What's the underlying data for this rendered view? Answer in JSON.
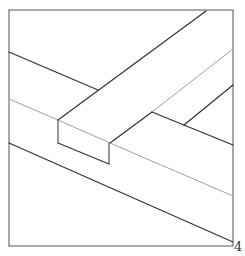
{
  "diagram": {
    "frame": {
      "x1": 9,
      "y1": 10,
      "x2": 233,
      "y2": 246,
      "color": "#555555"
    },
    "label": {
      "text": "4",
      "x": 234,
      "y": 240
    },
    "lines": [
      {
        "name": "back-board-top-edge-left",
        "x1": 9,
        "y1": 52,
        "x2": 98,
        "y2": 90,
        "color": "#333333",
        "width": 1.2
      },
      {
        "name": "beam-top-left-edge",
        "x1": 58,
        "y1": 120,
        "x2": 206,
        "y2": 11,
        "color": "#333333",
        "width": 1.2
      },
      {
        "name": "beam-top-right-edge",
        "x1": 110,
        "y1": 143,
        "x2": 152,
        "y2": 112,
        "color": "#333333",
        "width": 1.2
      },
      {
        "name": "beam-right-continuation",
        "x1": 152,
        "y1": 112,
        "x2": 233,
        "y2": 49,
        "color": "#888888",
        "width": 0.8
      },
      {
        "name": "back-board-edge-right",
        "x1": 152,
        "y1": 112,
        "x2": 233,
        "y2": 145,
        "color": "#333333",
        "width": 1.2
      },
      {
        "name": "rear-board-edge",
        "x1": 184,
        "y1": 125,
        "x2": 233,
        "y2": 85,
        "color": "#333333",
        "width": 1.2
      },
      {
        "name": "board-middle-thin-line-left",
        "x1": 9,
        "y1": 99,
        "x2": 58,
        "y2": 120,
        "color": "#888888",
        "width": 0.8
      },
      {
        "name": "board-middle-thin-line-right",
        "x1": 110,
        "y1": 143,
        "x2": 233,
        "y2": 196,
        "color": "#888888",
        "width": 0.8
      },
      {
        "name": "board-bottom-edge",
        "x1": 9,
        "y1": 143,
        "x2": 233,
        "y2": 242,
        "color": "#333333",
        "width": 1.2
      },
      {
        "name": "beam-front-left",
        "x1": 58,
        "y1": 120,
        "x2": 58,
        "y2": 143,
        "color": "#333333",
        "width": 1.0
      },
      {
        "name": "beam-front-bottom",
        "x1": 58,
        "y1": 143,
        "x2": 109,
        "y2": 164,
        "color": "#333333",
        "width": 1.2
      },
      {
        "name": "beam-front-right",
        "x1": 109,
        "y1": 143,
        "x2": 109,
        "y2": 164,
        "color": "#333333",
        "width": 1.0
      },
      {
        "name": "beam-front-top",
        "x1": 58,
        "y1": 120,
        "x2": 110,
        "y2": 143,
        "color": "#888888",
        "width": 0.8
      }
    ]
  }
}
